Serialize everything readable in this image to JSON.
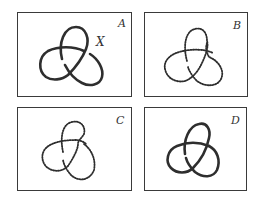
{
  "figure": {
    "title": "",
    "panels": [
      {
        "id": "A",
        "label": "A",
        "annotation": "X",
        "stroke": "solid"
      },
      {
        "id": "B",
        "label": "B",
        "stroke": "dotted"
      },
      {
        "id": "C",
        "label": "C",
        "stroke": "dotted"
      },
      {
        "id": "D",
        "label": "D",
        "stroke": "solid"
      }
    ]
  },
  "colors": {
    "stroke": "#2e2e2e",
    "border": "#3a3a3a",
    "background": "#ffffff"
  }
}
